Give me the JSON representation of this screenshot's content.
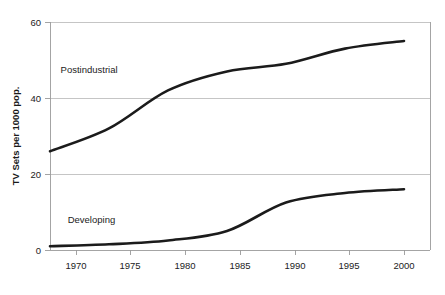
{
  "chart_data": {
    "type": "line",
    "title": "",
    "subtitle": "",
    "xlabel": "",
    "ylabel": "TV Sets per 1000 pop.",
    "x": [
      1970,
      1975,
      1980,
      1985,
      1990,
      1995,
      2000
    ],
    "categories": [
      "1970",
      "1975",
      "1980",
      "1985",
      "1990",
      "1995",
      "2000"
    ],
    "xlim": [
      1970,
      2000
    ],
    "ylim": [
      0,
      60
    ],
    "y_ticks": [
      0,
      20,
      40,
      60
    ],
    "y_tick_labels": [
      "0",
      "20",
      "40",
      "60"
    ],
    "x_ticks": [
      1970,
      1975,
      1980,
      1985,
      1990,
      1995,
      2000
    ],
    "x_tick_labels": [
      "1970",
      "1975",
      "1980",
      "1985",
      "1990",
      "1995",
      "2000"
    ],
    "grid": "horizontal",
    "legend": "none",
    "series": [
      {
        "name": "Postindustrial",
        "color": "#1b1b1b",
        "values": [
          26,
          32,
          42,
          47,
          49,
          53,
          55
        ],
        "annotation": {
          "text": "Postindustrial",
          "x": 1970.9,
          "y": 46.5
        }
      },
      {
        "name": "Developing",
        "color": "#1b1b1b",
        "values": [
          1,
          1.5,
          2.5,
          5,
          12.5,
          15,
          16
        ],
        "annotation": {
          "text": "Developing",
          "x": 1971.5,
          "y": 7.2
        }
      }
    ]
  },
  "axis": {
    "y_title": "TV Sets per 1000 pop.",
    "y_labels": {
      "t0": "0",
      "t20": "20",
      "t40": "40",
      "t60": "60"
    },
    "x_labels": {
      "p1970": "1970",
      "p1975": "1975",
      "p1980": "1980",
      "p1985": "1985",
      "p1990": "1990",
      "p1995": "1995",
      "p2000": "2000"
    }
  },
  "annotations": {
    "postindustrial": "Postindustrial",
    "developing": "Developing"
  }
}
